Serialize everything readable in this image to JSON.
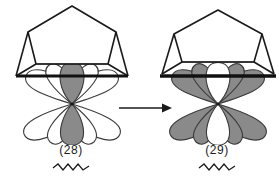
{
  "figure": {
    "kind": "orbital-interaction-diagram",
    "background_color": "#ffffff",
    "ink_color": "#1a1a1a",
    "lobe_filled_color": "#8a8a8a",
    "lobe_empty_color": "#ffffff",
    "lobe_outline_color": "#3a3a3a"
  },
  "structures": [
    {
      "id": "left",
      "label": "(28)",
      "underline": "squiggle",
      "ring": {
        "name": "cyclopentadienyl-cage",
        "shape": "pentagon-prism-perspective",
        "front_edge": "thick-black-bar"
      },
      "orbital": {
        "name": "radiating-lobe-set",
        "lobe_count": 5,
        "upper_lobe_count": 5,
        "center_lobe_fill": "filled",
        "outer_lobe_fill": "empty",
        "center_lobe_orientation": "vertical"
      }
    },
    {
      "id": "right",
      "label": "(29)",
      "underline": "squiggle",
      "ring": {
        "name": "cyclopentadienyl-cage",
        "shape": "pentagon-prism-perspective",
        "front_edge": "thick-black-bar"
      },
      "orbital": {
        "name": "radiating-lobe-set",
        "lobe_count": 5,
        "upper_lobe_count": 5,
        "center_lobe_fill": "empty",
        "outer_lobe_fill": "filled",
        "center_lobe_orientation": "vertical"
      }
    }
  ],
  "arrow": {
    "name": "reaction-arrow",
    "direction": "right",
    "label": ""
  }
}
